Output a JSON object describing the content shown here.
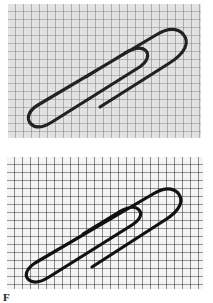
{
  "figure": {
    "panels": [
      {
        "label": "top",
        "description": "Paperclip on grid paper, low contrast / blurred",
        "background": "#e2e2e2",
        "grid_color": "#8a8a8a",
        "clip_color": "#222222",
        "grid_cell_px": 8
      },
      {
        "label": "bottom",
        "description": "Paperclip on grid paper, high contrast / sharp",
        "background": "#f4f4f4",
        "grid_color": "#333333",
        "clip_color": "#111111",
        "grid_cell_px": 8
      }
    ],
    "caption": "F"
  }
}
